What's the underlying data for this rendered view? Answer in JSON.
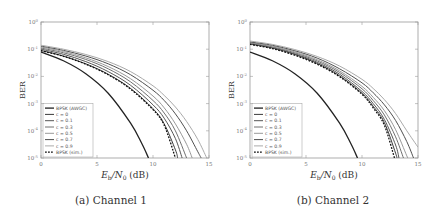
{
  "figure": {
    "captions": [
      "(a) Channel 1",
      "(b) Channel 2"
    ]
  },
  "chart_data": [
    {
      "type": "line",
      "title": "(a) Channel 1",
      "xlabel": "E_b/N_0 (dB)",
      "ylabel": "BER",
      "xscale": "linear",
      "yscale": "log",
      "xlim": [
        0,
        15
      ],
      "ylim": [
        1e-05,
        1
      ],
      "xticks": [
        "0",
        "5",
        "10",
        "15"
      ],
      "yticks": [
        "10^0",
        "10^-1",
        "10^-2",
        "10^-3",
        "10^-4",
        "10^-5"
      ],
      "grid": false,
      "legend_position": "lower left",
      "series": [
        {
          "name": "BPSK (AWGC)",
          "style": "solid",
          "color": "#222222",
          "width": 1.3,
          "x": [
            0,
            2,
            4,
            6,
            8,
            9,
            9.6
          ],
          "y": [
            0.079,
            0.0375,
            0.0125,
            0.0024,
            0.00019,
            3.4e-05,
            1e-05
          ]
        },
        {
          "name": "c = 0",
          "style": "solid",
          "color": "#3a3a3a",
          "width": 1.0,
          "x": [
            0,
            2,
            4,
            6,
            8,
            10,
            11,
            12,
            12.2
          ],
          "y": [
            0.09,
            0.056,
            0.029,
            0.012,
            0.0036,
            0.00065,
            0.00018,
            2e-05,
            1e-05
          ]
        },
        {
          "name": "c = 0.1",
          "style": "solid",
          "color": "#555555",
          "width": 1.0,
          "x": [
            0,
            2,
            4,
            6,
            8,
            10,
            11,
            12,
            12.6
          ],
          "y": [
            0.1,
            0.065,
            0.035,
            0.015,
            0.0047,
            0.0009,
            0.00029,
            5.2e-05,
            1e-05
          ]
        },
        {
          "name": "c = 0.3",
          "style": "solid",
          "color": "#707070",
          "width": 1.0,
          "x": [
            0,
            2,
            4,
            6,
            8,
            10,
            11,
            12,
            13
          ],
          "y": [
            0.11,
            0.074,
            0.042,
            0.019,
            0.0063,
            0.0013,
            0.00045,
            0.0001,
            1e-05
          ]
        },
        {
          "name": "c = 0.5",
          "style": "solid",
          "color": "#999999",
          "width": 1.0,
          "x": [
            0,
            2,
            4,
            6,
            8,
            10,
            11,
            12,
            13,
            13.5
          ],
          "y": [
            0.12,
            0.082,
            0.048,
            0.023,
            0.0082,
            0.0019,
            0.0007,
            0.00018,
            3.2e-05,
            1e-05
          ]
        },
        {
          "name": "c = 0.7",
          "style": "solid",
          "color": "#505050",
          "width": 1.0,
          "x": [
            0,
            2,
            4,
            6,
            8,
            10,
            11,
            12,
            13,
            14,
            14.3
          ],
          "y": [
            0.13,
            0.091,
            0.056,
            0.029,
            0.0115,
            0.0031,
            0.0013,
            0.00042,
            0.0001,
            1.7e-05,
            1e-05
          ]
        },
        {
          "name": "c = 0.9",
          "style": "solid",
          "color": "#aaaaaa",
          "width": 1.0,
          "x": [
            0,
            2,
            4,
            6,
            8,
            10,
            11,
            12,
            13,
            14,
            14.8
          ],
          "y": [
            0.14,
            0.1,
            0.064,
            0.035,
            0.015,
            0.0045,
            0.002,
            0.00075,
            0.00022,
            4.8e-05,
            1e-05
          ]
        },
        {
          "name": "BPSK (sim.)",
          "style": "dashed",
          "color": "#111111",
          "width": 1.3,
          "x": [
            0,
            2,
            4,
            6,
            8,
            10,
            11,
            12
          ],
          "y": [
            0.088,
            0.055,
            0.028,
            0.0115,
            0.0034,
            0.0006,
            0.00016,
            1e-05
          ]
        }
      ]
    },
    {
      "type": "line",
      "title": "(b) Channel 2",
      "xlabel": "E_b/N_0 (dB)",
      "ylabel": "BER",
      "xscale": "linear",
      "yscale": "log",
      "xlim": [
        0,
        15
      ],
      "ylim": [
        1e-05,
        1
      ],
      "xticks": [
        "0",
        "5",
        "10",
        "15"
      ],
      "yticks": [
        "10^0",
        "10^-1",
        "10^-2",
        "10^-3",
        "10^-4",
        "10^-5"
      ],
      "grid": false,
      "legend_position": "lower left",
      "series": [
        {
          "name": "BPSK (AWGC)",
          "style": "solid",
          "color": "#222222",
          "width": 1.3,
          "x": [
            0,
            2,
            4,
            6,
            8,
            9,
            9.6
          ],
          "y": [
            0.079,
            0.0375,
            0.0125,
            0.0024,
            0.00019,
            3.4e-05,
            1e-05
          ]
        },
        {
          "name": "c = 0",
          "style": "solid",
          "color": "#3a3a3a",
          "width": 1.0,
          "x": [
            0,
            2,
            4,
            6,
            8,
            10,
            11,
            12,
            13,
            13.1
          ],
          "y": [
            0.155,
            0.11,
            0.064,
            0.03,
            0.0105,
            0.0024,
            0.0008,
            0.0002,
            1.5e-05,
            1e-05
          ]
        },
        {
          "name": "c = 0.1",
          "style": "solid",
          "color": "#555555",
          "width": 1.0,
          "x": [
            0,
            2,
            4,
            6,
            8,
            10,
            11,
            12,
            13,
            13.3
          ],
          "y": [
            0.16,
            0.115,
            0.068,
            0.033,
            0.012,
            0.0028,
            0.001,
            0.00026,
            3e-05,
            1e-05
          ]
        },
        {
          "name": "c = 0.3",
          "style": "solid",
          "color": "#707070",
          "width": 1.0,
          "x": [
            0,
            2,
            4,
            6,
            8,
            10,
            11,
            12,
            13,
            13.7
          ],
          "y": [
            0.17,
            0.122,
            0.074,
            0.037,
            0.014,
            0.0035,
            0.0013,
            0.00038,
            6e-05,
            1e-05
          ]
        },
        {
          "name": "c = 0.5",
          "style": "solid",
          "color": "#999999",
          "width": 1.0,
          "x": [
            0,
            2,
            4,
            6,
            8,
            10,
            11,
            12,
            13,
            14,
            14.1
          ],
          "y": [
            0.175,
            0.13,
            0.08,
            0.041,
            0.016,
            0.0043,
            0.0017,
            0.00055,
            0.00011,
            1.2e-05,
            1e-05
          ]
        },
        {
          "name": "c = 0.7",
          "style": "solid",
          "color": "#505050",
          "width": 1.0,
          "x": [
            0,
            2,
            4,
            6,
            8,
            10,
            11,
            12,
            13,
            14,
            14.6
          ],
          "y": [
            0.185,
            0.14,
            0.088,
            0.047,
            0.019,
            0.0058,
            0.0025,
            0.0009,
            0.00024,
            4e-05,
            1e-05
          ]
        },
        {
          "name": "c = 0.9",
          "style": "solid",
          "color": "#aaaaaa",
          "width": 1.0,
          "x": [
            0,
            2,
            4,
            6,
            8,
            10,
            11,
            12,
            13,
            14,
            15
          ],
          "y": [
            0.2,
            0.15,
            0.097,
            0.054,
            0.024,
            0.0078,
            0.0036,
            0.0014,
            0.00043,
            0.0001,
            2.5e-05
          ]
        },
        {
          "name": "BPSK (sim.)",
          "style": "dashed",
          "color": "#111111",
          "width": 1.3,
          "x": [
            0,
            2,
            4,
            6,
            8,
            10,
            11,
            12,
            12.9
          ],
          "y": [
            0.15,
            0.105,
            0.06,
            0.028,
            0.0098,
            0.0022,
            0.0007,
            0.00016,
            1e-05
          ]
        }
      ]
    }
  ]
}
